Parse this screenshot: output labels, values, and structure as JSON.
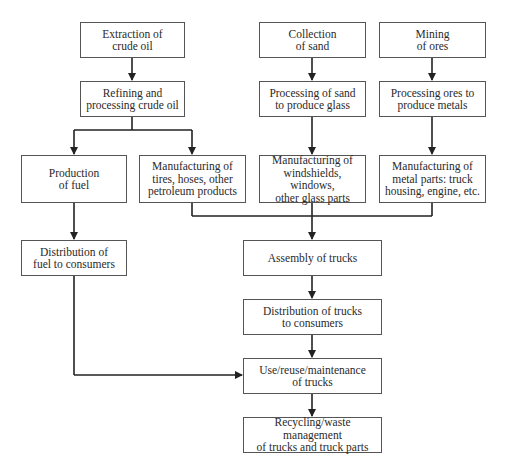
{
  "diagram": {
    "type": "flowchart",
    "nodes": [
      {
        "id": "extraction",
        "label": "Extraction of\ncrude oil",
        "x": 80,
        "y": 22,
        "w": 105,
        "h": 36
      },
      {
        "id": "collection",
        "label": "Collection\nof sand",
        "x": 259,
        "y": 22,
        "w": 107,
        "h": 36
      },
      {
        "id": "mining",
        "label": "Mining\nof ores",
        "x": 379,
        "y": 22,
        "w": 107,
        "h": 36
      },
      {
        "id": "refining",
        "label": "Refining and\nprocessing crude oil",
        "x": 80,
        "y": 81,
        "w": 105,
        "h": 36
      },
      {
        "id": "processing_sand",
        "label": "Processing of sand\nto produce glass",
        "x": 259,
        "y": 81,
        "w": 107,
        "h": 36
      },
      {
        "id": "processing_ores",
        "label": "Processing ores to\nproduce metals",
        "x": 379,
        "y": 81,
        "w": 107,
        "h": 36
      },
      {
        "id": "production_fuel",
        "label": "Production\nof fuel",
        "x": 21,
        "y": 155,
        "w": 106,
        "h": 48
      },
      {
        "id": "manufacturing_tires",
        "label": "Manufacturing of\ntires, hoses, other\npetroleum products",
        "x": 139,
        "y": 155,
        "w": 107,
        "h": 48
      },
      {
        "id": "manufacturing_glass",
        "label": "Manufacturing of\nwindshields, windows,\nother glass parts",
        "x": 259,
        "y": 155,
        "w": 107,
        "h": 48
      },
      {
        "id": "manufacturing_metal",
        "label": "Manufacturing of\nmetal parts: truck\nhousing, engine, etc.",
        "x": 379,
        "y": 155,
        "w": 107,
        "h": 48
      },
      {
        "id": "distribution_fuel",
        "label": "Distribution of\nfuel to consumers",
        "x": 21,
        "y": 240,
        "w": 106,
        "h": 36
      },
      {
        "id": "assembly",
        "label": "Assembly of trucks",
        "x": 243,
        "y": 240,
        "w": 139,
        "h": 36
      },
      {
        "id": "distribution_trucks",
        "label": "Distribution of trucks\nto consumers",
        "x": 243,
        "y": 299,
        "w": 139,
        "h": 36
      },
      {
        "id": "use",
        "label": "Use/reuse/maintenance\nof trucks",
        "x": 243,
        "y": 358,
        "w": 139,
        "h": 36
      },
      {
        "id": "recycling",
        "label": "Recycling/waste management\nof trucks and truck parts",
        "x": 243,
        "y": 417,
        "w": 139,
        "h": 36
      }
    ],
    "edges": [
      {
        "from": "extraction",
        "to": "refining"
      },
      {
        "from": "collection",
        "to": "processing_sand"
      },
      {
        "from": "mining",
        "to": "processing_ores"
      },
      {
        "from": "refining",
        "to": "production_fuel"
      },
      {
        "from": "refining",
        "to": "manufacturing_tires"
      },
      {
        "from": "processing_sand",
        "to": "manufacturing_glass"
      },
      {
        "from": "processing_ores",
        "to": "manufacturing_metal"
      },
      {
        "from": "production_fuel",
        "to": "distribution_fuel"
      },
      {
        "from": "manufacturing_tires",
        "to": "assembly"
      },
      {
        "from": "manufacturing_glass",
        "to": "assembly"
      },
      {
        "from": "manufacturing_metal",
        "to": "assembly"
      },
      {
        "from": "assembly",
        "to": "distribution_trucks"
      },
      {
        "from": "distribution_trucks",
        "to": "use"
      },
      {
        "from": "distribution_fuel",
        "to": "use"
      },
      {
        "from": "use",
        "to": "recycling"
      }
    ],
    "colors": {
      "line": "#222222",
      "border": "#555555",
      "text": "#2a2a2a",
      "background": "#ffffff"
    }
  }
}
